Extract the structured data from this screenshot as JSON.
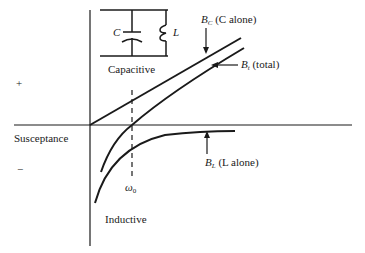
{
  "diagram": {
    "axis_label": "Susceptance",
    "positive_sign": "+",
    "negative_sign": "−",
    "omega_label": "ω",
    "omega_sub": "0",
    "circuit": {
      "capacitor_label": "C",
      "inductor_label": "L",
      "caption": "Capacitive"
    },
    "region_lower": "Inductive",
    "curves": [
      {
        "id": "BC",
        "symbol": "B",
        "sub": "C",
        "desc": "(C alone)"
      },
      {
        "id": "Bt",
        "symbol": "B",
        "sub": "t",
        "desc": "(total)"
      },
      {
        "id": "BL",
        "symbol": "B",
        "sub": "L",
        "desc": "(L alone)"
      }
    ],
    "colors": {
      "ink": "#1a1a1a",
      "background": "#ffffff"
    }
  }
}
